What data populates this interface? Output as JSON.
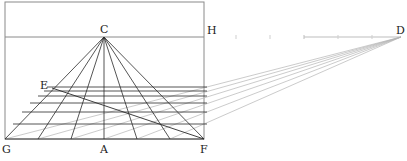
{
  "figure": {
    "colors": {
      "frame": "#8a8a8a",
      "construction": "#2a2a2a",
      "guide": "#b5b5b5",
      "ticks": "#bdbdbd"
    },
    "labels": {
      "C": "C",
      "H": "H",
      "D": "D",
      "E": "E",
      "G": "G",
      "A": "A",
      "F": "F"
    },
    "points": {
      "C": [
        104,
        37
      ],
      "H": [
        204,
        37
      ],
      "D": [
        401,
        37
      ],
      "E": [
        52,
        88
      ],
      "G": [
        5,
        139
      ],
      "A": [
        104,
        139
      ],
      "F": [
        204,
        139
      ]
    },
    "frame": {
      "x": 5,
      "y": 2,
      "width": 199,
      "height": 137
    },
    "horizon_y": 37,
    "base_points_x": [
      5,
      38,
      71,
      104,
      137,
      170,
      204
    ],
    "transversals_y": [
      87,
      91,
      96,
      103,
      112,
      124,
      139
    ],
    "horizon_ticks_x": [
      236,
      270,
      304,
      338,
      372
    ]
  }
}
